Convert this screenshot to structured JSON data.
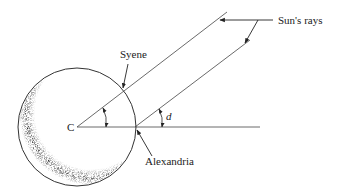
{
  "diagram": {
    "labels": {
      "center": "C",
      "syene": "Syene",
      "alexandria": "Alexandria",
      "sun_rays": "Sun's rays",
      "angle": "d"
    },
    "geometry": {
      "earth_center": [
        77,
        127
      ],
      "earth_radius": 59,
      "syene_point": [
        123,
        92
      ],
      "alexandria_point": [
        135,
        127
      ],
      "upper_ray_end": [
        227,
        12
      ],
      "lower_ray_end": [
        250,
        40
      ],
      "horizontal_line_end": [
        260,
        127
      ]
    },
    "colors": {
      "line": "#333333",
      "shadow": "#222222",
      "background": "#ffffff"
    }
  }
}
